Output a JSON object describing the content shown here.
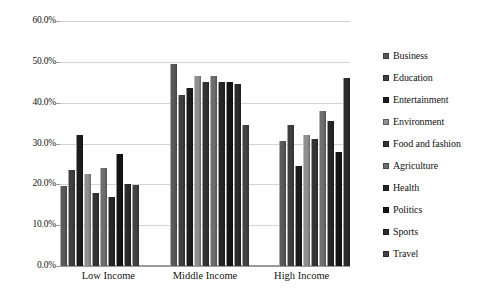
{
  "chart_data": {
    "type": "bar",
    "title": "",
    "subtitle": "",
    "xlabel": "",
    "ylabel": "",
    "grid": true,
    "legend_position": "right",
    "categories": [
      "Low Income",
      "Middle Income",
      "High Income"
    ],
    "ylim": [
      0,
      60
    ],
    "ytick_step": 10,
    "ytick_labels": [
      "60.0%",
      "50.0%",
      "40.0%",
      "30.0%",
      "20.0%",
      "10.0%",
      "0.0%"
    ],
    "ytick_values": [
      60,
      50,
      40,
      30,
      20,
      10,
      0
    ],
    "value_suffix": "%",
    "series": [
      {
        "name": "Business",
        "color": "#595959",
        "values": [
          19.5,
          49.5,
          30.5
        ]
      },
      {
        "name": "Education",
        "color": "#3f3f3f",
        "values": [
          23.5,
          42.0,
          34.5
        ]
      },
      {
        "name": "Entertainment",
        "color": "#1c1c1c",
        "values": [
          32.0,
          43.5,
          24.5
        ]
      },
      {
        "name": "Environment",
        "color": "#8f8f8f",
        "values": [
          22.5,
          46.5,
          32.0
        ]
      },
      {
        "name": "Food and fashion",
        "color": "#333333",
        "values": [
          18.0,
          45.0,
          31.0
        ]
      },
      {
        "name": "Agriculture",
        "color": "#6e6e6e",
        "values": [
          24.0,
          46.5,
          38.0
        ]
      },
      {
        "name": "Health",
        "color": "#262626",
        "values": [
          17.0,
          45.0,
          35.5
        ]
      },
      {
        "name": "Politics",
        "color": "#141414",
        "values": [
          27.5,
          45.0,
          28.0
        ]
      },
      {
        "name": "Sports",
        "color": "#2b2b2b",
        "values": [
          20.0,
          44.5,
          46.0
        ]
      },
      {
        "name": "Travel",
        "color": "#424242",
        "values": [
          19.8,
          34.5,
          0.0
        ]
      }
    ]
  },
  "legend": {
    "items": [
      {
        "label": "Business"
      },
      {
        "label": "Education"
      },
      {
        "label": "Entertainment"
      },
      {
        "label": "Environment"
      },
      {
        "label": "Food and fashion"
      },
      {
        "label": "Agriculture"
      },
      {
        "label": "Health"
      },
      {
        "label": "Politics"
      },
      {
        "label": "Sports"
      },
      {
        "label": "Travel"
      }
    ]
  },
  "colors": {
    "gridline": "#d3d3d3",
    "axis": "#9a9a9a",
    "text": "#121212",
    "background": "#ffffff"
  }
}
